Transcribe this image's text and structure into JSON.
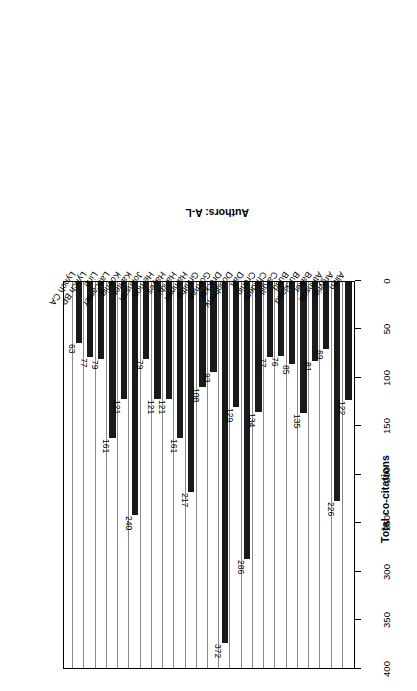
{
  "chart_data": {
    "type": "bar",
    "orientation": "horizontal-rotated-180",
    "title": "",
    "xlabel": "Authors: A-L",
    "ylabel": "Total co-citations",
    "ylim": [
      0,
      400
    ],
    "ytick_labels": [
      "0",
      "50",
      "100",
      "150",
      "200",
      "250",
      "300",
      "350",
      "400"
    ],
    "ytick_values": [
      0,
      50,
      100,
      150,
      200,
      250,
      300,
      350,
      400
    ],
    "grid": true,
    "legend": false,
    "bar_color": "#1a1a1a",
    "categories": [
      "Allen",
      "Argyris",
      "Atkinson",
      "Baker",
      "Buckland",
      "Budd",
      "Cargill",
      "Childers",
      "Cronin",
      "Daft",
      "Dougherty",
      "Drucker",
      "Gorman",
      "Griffiths",
      "Hammer",
      "Handy",
      "Hayes",
      "Hernon",
      "Johnson",
      "Kanter",
      "Koenig",
      "Lancaster",
      "Line",
      "Lynch BP",
      "Lynch CA",
      ""
    ],
    "values": [
      122,
      226,
      69,
      81,
      135,
      85,
      76,
      77,
      134,
      286,
      129,
      372,
      93,
      108,
      217,
      161,
      121,
      121,
      79,
      240,
      121,
      161,
      79,
      77,
      63,
      0
    ],
    "data_labels": [
      "122",
      "226",
      "69",
      "81",
      "135",
      "85",
      "76",
      "77",
      "134",
      "286",
      "129",
      "372",
      "93",
      "108",
      "217",
      "161",
      "121",
      "121",
      "79",
      "240",
      "121",
      "161",
      "79",
      "77",
      "63",
      ""
    ]
  }
}
